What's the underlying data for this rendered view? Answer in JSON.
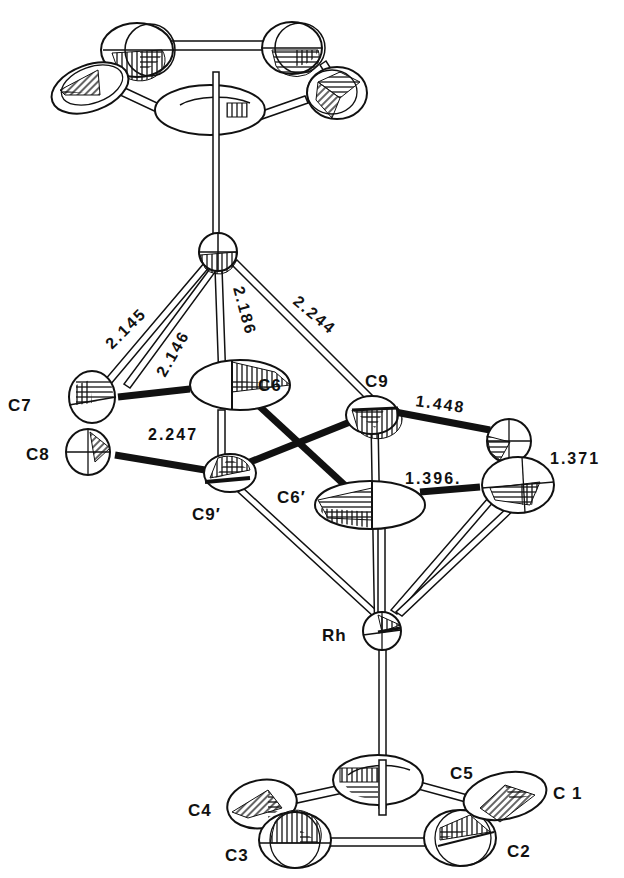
{
  "figure": {
    "type": "ORTEP drawing"
  },
  "atoms": {
    "top_metal": {
      "label": ""
    },
    "C6": {
      "label": "C6"
    },
    "C7": {
      "label": "C7"
    },
    "C8": {
      "label": "C8"
    },
    "C9": {
      "label": "C9"
    },
    "C9p": {
      "label": "C9′"
    },
    "C6p": {
      "label": "C6′"
    },
    "Rh": {
      "label": "Rh"
    },
    "C1": {
      "label": "C 1"
    },
    "C2": {
      "label": "C2"
    },
    "C3": {
      "label": "C3"
    },
    "C4": {
      "label": "C4"
    },
    "C5": {
      "label": "C5"
    }
  },
  "bond_lengths": {
    "M_C7a": "2.145",
    "M_C7b": "2.146",
    "M_C6": "2.186",
    "M_C9": "2.244",
    "C6_C9p": "2.247",
    "C9_right": "1.448",
    "right_vertical": "1.371",
    "C6p_right": "1.396."
  }
}
